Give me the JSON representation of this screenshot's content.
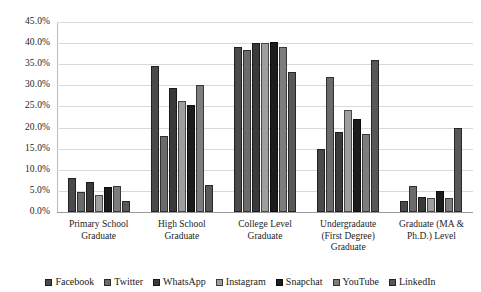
{
  "chart_data": {
    "type": "bar",
    "title": "",
    "subtitle": "",
    "xlabel": "",
    "ylabel": "",
    "ylim": [
      0,
      45
    ],
    "grid": true,
    "legend_position": "bottom",
    "ytick_labels": [
      "45.0%",
      "40.0%",
      "35.0%",
      "30.0%",
      "25.0%",
      "20.0%",
      "15.0%",
      "10.0%",
      "5.0%",
      "0.0%"
    ],
    "ytick_values": [
      45,
      40,
      35,
      30,
      25,
      20,
      15,
      10,
      5,
      0
    ],
    "categories": [
      "Primary School Graduate",
      "High School Graduate",
      "College Level Graduate",
      "Undergradaute (First Degree) Graduate",
      "Graduate (MA & Ph.D.) Level"
    ],
    "series": [
      {
        "name": "Facebook",
        "color": "#4a4a4a",
        "values": [
          8.0,
          34.5,
          39.1,
          14.9,
          2.6
        ]
      },
      {
        "name": "Twitter",
        "color": "#6b6b6b",
        "values": [
          4.7,
          18.0,
          38.4,
          31.9,
          6.1
        ]
      },
      {
        "name": "WhatsApp",
        "color": "#3a3a3a",
        "values": [
          7.0,
          29.4,
          40.1,
          18.9,
          3.6
        ]
      },
      {
        "name": "Instagram",
        "color": "#9e9e9e",
        "values": [
          4.0,
          26.3,
          40.1,
          24.1,
          3.3
        ]
      },
      {
        "name": "Snapchat",
        "color": "#1c1c1c",
        "values": [
          6.0,
          25.4,
          40.2,
          22.0,
          5.0
        ]
      },
      {
        "name": "YouTube",
        "color": "#7d7d7d",
        "values": [
          6.2,
          30.1,
          39.1,
          18.4,
          3.3
        ]
      },
      {
        "name": "LinkedIn",
        "color": "#585858",
        "values": [
          2.5,
          6.4,
          33.2,
          36.0,
          19.8
        ]
      }
    ]
  }
}
